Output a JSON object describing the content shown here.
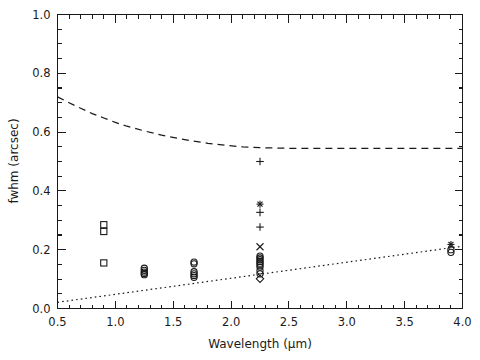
{
  "chart_data": {
    "type": "scatter",
    "title": "",
    "xlabel": "Wavelength (μm)",
    "ylabel": "fwhm (arcsec)",
    "xlim": [
      0.5,
      4.0
    ],
    "ylim": [
      0.0,
      1.0
    ],
    "xticks": [
      0.5,
      1.0,
      1.5,
      2.0,
      2.5,
      3.0,
      3.5,
      4.0
    ],
    "xtick_labels": [
      "0.5",
      "1.0",
      "1.5",
      "2.0",
      "2.5",
      "3.0",
      "3.5",
      "4.0"
    ],
    "yticks": [
      0.0,
      0.2,
      0.4,
      0.6,
      0.8,
      1.0
    ],
    "ytick_labels": [
      "0.0",
      "0.2",
      "0.4",
      "0.6",
      "0.8",
      "1.0"
    ],
    "xminor_step": 0.1,
    "yminor_step": 0.05,
    "grid": false,
    "legend": null,
    "series": [
      {
        "name": "seeing-limit-dashed",
        "style": "dashed-line",
        "x": [
          0.5,
          0.6,
          0.7,
          0.8,
          0.9,
          1.0,
          1.1,
          1.25,
          1.4,
          1.55,
          1.65,
          1.8,
          1.95,
          2.1,
          2.25,
          2.5,
          2.75,
          3.0,
          3.25,
          3.5,
          3.75,
          4.0
        ],
        "values": [
          0.72,
          0.7,
          0.681,
          0.663,
          0.648,
          0.633,
          0.62,
          0.604,
          0.59,
          0.578,
          0.571,
          0.562,
          0.555,
          0.55,
          0.547,
          0.545,
          0.545,
          0.545,
          0.545,
          0.545,
          0.545,
          0.545
        ]
      },
      {
        "name": "diffraction-limit-dotted",
        "style": "dotted-line",
        "x": [
          0.5,
          4.0
        ],
        "values": [
          0.021,
          0.212
        ]
      },
      {
        "name": "measurements-open-square",
        "style": "open-square",
        "x": [
          0.9,
          0.9,
          0.9
        ],
        "values": [
          0.285,
          0.262,
          0.155
        ]
      },
      {
        "name": "measurements-j-band",
        "style": "open-circle",
        "x": [
          1.25,
          1.25,
          1.25,
          1.25,
          1.25
        ],
        "values": [
          0.137,
          0.13,
          0.124,
          0.119,
          0.115
        ]
      },
      {
        "name": "measurements-h-band",
        "style": "open-circle",
        "x": [
          1.68,
          1.68,
          1.68,
          1.68,
          1.68,
          1.68
        ],
        "values": [
          0.158,
          0.152,
          0.125,
          0.118,
          0.112,
          0.106
        ]
      },
      {
        "name": "measurements-k-band-plus",
        "style": "plus",
        "x": [
          2.25,
          2.25,
          2.25
        ],
        "values": [
          0.5,
          0.327,
          0.277
        ]
      },
      {
        "name": "measurements-k-band-asterisk",
        "style": "asterisk",
        "x": [
          2.25
        ],
        "values": [
          0.355
        ]
      },
      {
        "name": "measurements-k-band-cross",
        "style": "cross",
        "x": [
          2.25
        ],
        "values": [
          0.21
        ]
      },
      {
        "name": "measurements-k-band-stack",
        "style": "open-circle",
        "x": [
          2.25,
          2.25,
          2.25,
          2.25,
          2.25,
          2.25,
          2.25,
          2.25,
          2.25
        ],
        "values": [
          0.178,
          0.172,
          0.166,
          0.16,
          0.154,
          0.148,
          0.141,
          0.128,
          0.118
        ]
      },
      {
        "name": "measurements-k-band-diamond",
        "style": "diamond",
        "x": [
          2.25
        ],
        "values": [
          0.101
        ]
      },
      {
        "name": "measurements-l-band-asterisk",
        "style": "asterisk",
        "x": [
          3.9
        ],
        "values": [
          0.218
        ]
      },
      {
        "name": "measurements-l-band-circles",
        "style": "open-circle",
        "x": [
          3.9,
          3.9
        ],
        "values": [
          0.2,
          0.191
        ]
      }
    ]
  },
  "figure": {
    "background_color": "#ffffff",
    "foreground_color": "#1a1a1a"
  }
}
